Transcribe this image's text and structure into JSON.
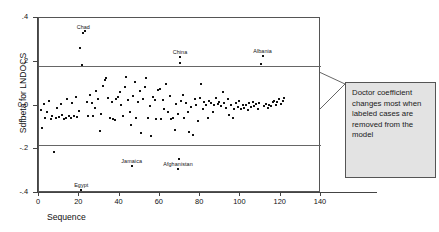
{
  "chart_data": {
    "type": "scatter",
    "title": "",
    "xlabel": "Sequence",
    "ylabel": "Sdfbeta for LNDOCS",
    "xlim": [
      0,
      140
    ],
    "ylim": [
      -0.4,
      0.4
    ],
    "xticks": [
      0,
      20,
      40,
      60,
      80,
      100,
      120,
      140
    ],
    "xtick_labels": [
      "0",
      "20",
      "40",
      "60",
      "80",
      "100",
      "120",
      "140"
    ],
    "yticks": [
      0.4,
      0.2,
      0.0,
      -0.2,
      -0.4
    ],
    "ytick_labels": [
      ".4",
      ".2",
      "0.0",
      "-.2",
      "-.4"
    ],
    "grid": false,
    "legend": null,
    "reference_lines": [
      {
        "orientation": "horizontal",
        "value": 0.18
      },
      {
        "orientation": "horizontal",
        "value": -0.18
      }
    ],
    "annotations": [
      {
        "text": "Doctor coefficient changes most when labeled cases are removed from the model",
        "kind": "callout-box"
      }
    ],
    "point_labels": [
      {
        "label": "Chad",
        "x": 22,
        "y": 0.335
      },
      {
        "label": "China",
        "x": 70,
        "y": 0.222
      },
      {
        "label": "Albania",
        "x": 111,
        "y": 0.228
      },
      {
        "label": "Jamaica",
        "x": 46,
        "y": -0.275
      },
      {
        "label": "Afghanistan",
        "x": 69,
        "y": -0.292
      },
      {
        "label": "Egypt",
        "x": 21,
        "y": -0.388
      }
    ],
    "points": [
      [
        1,
        -0.022
      ],
      [
        1.6,
        -0.105
      ],
      [
        2.4,
        0.005
      ],
      [
        3.2,
        -0.055
      ],
      [
        4.1,
        -0.03
      ],
      [
        5.0,
        0.022
      ],
      [
        5.8,
        -0.06
      ],
      [
        6.6,
        -0.048
      ],
      [
        7.4,
        -0.212
      ],
      [
        8.3,
        -0.057
      ],
      [
        9.1,
        -0.012
      ],
      [
        9.9,
        -0.052
      ],
      [
        10.7,
        0.006
      ],
      [
        11.6,
        -0.044
      ],
      [
        12.4,
        -0.06
      ],
      [
        13.2,
        -0.055
      ],
      [
        14.0,
        0.03
      ],
      [
        14.9,
        -0.046
      ],
      [
        15.7,
        -0.058
      ],
      [
        16.5,
        0.01
      ],
      [
        17.3,
        -0.05
      ],
      [
        18.2,
        0.04
      ],
      [
        19.0,
        -0.052
      ],
      [
        19.8,
        -0.025
      ],
      [
        20.6,
        0.262
      ],
      [
        21.0,
        -0.388
      ],
      [
        21.5,
        0.185
      ],
      [
        21.9,
        0.33
      ],
      [
        22.8,
        0.34
      ],
      [
        23.6,
        0.015
      ],
      [
        24.4,
        -0.047
      ],
      [
        25.2,
        0.05
      ],
      [
        26.1,
        0.012
      ],
      [
        26.9,
        -0.048
      ],
      [
        27.7,
        -0.01
      ],
      [
        28.5,
        0.065
      ],
      [
        29.4,
        0.03
      ],
      [
        30.2,
        -0.115
      ],
      [
        31.0,
        -0.038
      ],
      [
        31.8,
        0.09
      ],
      [
        32.7,
        0.118
      ],
      [
        33.5,
        0.124
      ],
      [
        34.3,
        0.035
      ],
      [
        35.1,
        -0.058
      ],
      [
        36.0,
        0.018
      ],
      [
        36.8,
        -0.062
      ],
      [
        37.6,
        -0.066
      ],
      [
        38.4,
        0.028
      ],
      [
        39.3,
        0.037
      ],
      [
        40.1,
        0.06
      ],
      [
        40.9,
        0.002
      ],
      [
        41.7,
        -0.05
      ],
      [
        42.6,
        0.083
      ],
      [
        43.4,
        0.13
      ],
      [
        44.2,
        0.024
      ],
      [
        45.0,
        -0.03
      ],
      [
        45.9,
        -0.09
      ],
      [
        46.0,
        -0.275
      ],
      [
        46.7,
        0.045
      ],
      [
        47.5,
        0.106
      ],
      [
        48.3,
        -0.055
      ],
      [
        49.1,
        0.016
      ],
      [
        50.0,
        0.068
      ],
      [
        50.8,
        -0.125
      ],
      [
        51.6,
        0.032
      ],
      [
        52.4,
        0.086
      ],
      [
        53.3,
        0.126
      ],
      [
        54.1,
        -0.058
      ],
      [
        54.9,
        0.0
      ],
      [
        55.7,
        -0.138
      ],
      [
        56.6,
        0.04
      ],
      [
        57.4,
        0.025
      ],
      [
        58.2,
        -0.06
      ],
      [
        59.0,
        0.07
      ],
      [
        59.9,
        0.074
      ],
      [
        60.7,
        -0.063
      ],
      [
        61.5,
        0.026
      ],
      [
        62.3,
        -0.018
      ],
      [
        63.2,
        0.1
      ],
      [
        64.0,
        -0.03
      ],
      [
        64.8,
        0.044
      ],
      [
        65.6,
        -0.06
      ],
      [
        66.5,
        -0.057
      ],
      [
        67.3,
        -0.112
      ],
      [
        68.1,
        0.005
      ],
      [
        68.9,
        -0.04
      ],
      [
        69.0,
        -0.292
      ],
      [
        69.5,
        -0.245
      ],
      [
        69.8,
        0.193
      ],
      [
        70.0,
        0.222
      ],
      [
        70.6,
        0.022
      ],
      [
        71.4,
        0.05
      ],
      [
        72.2,
        -0.058
      ],
      [
        73.1,
        0.013
      ],
      [
        73.9,
        -0.03
      ],
      [
        74.7,
        -0.12
      ],
      [
        75.5,
        -0.008
      ],
      [
        76.4,
        -0.134
      ],
      [
        77.2,
        0.028
      ],
      [
        78.0,
        0.002
      ],
      [
        78.8,
        -0.07
      ],
      [
        79.7,
        0.036
      ],
      [
        80.5,
        0.1
      ],
      [
        81.3,
        -0.018
      ],
      [
        82.1,
        0.015
      ],
      [
        83.0,
        0.004
      ],
      [
        83.8,
        -0.055
      ],
      [
        84.6,
        0.02
      ],
      [
        85.4,
        0.012
      ],
      [
        86.3,
        -0.028
      ],
      [
        87.1,
        0.001
      ],
      [
        87.9,
        0.033
      ],
      [
        88.7,
        0.005
      ],
      [
        89.6,
        0.018
      ],
      [
        90.4,
        -0.004
      ],
      [
        91.2,
        0.06
      ],
      [
        92.0,
        0.01
      ],
      [
        92.9,
        -0.01
      ],
      [
        93.7,
        0.028
      ],
      [
        94.5,
        -0.042
      ],
      [
        95.3,
        0.002
      ],
      [
        96.2,
        -0.058
      ],
      [
        97.0,
        -0.016
      ],
      [
        97.8,
        0.013
      ],
      [
        98.6,
        -0.006
      ],
      [
        99.5,
        0.02
      ],
      [
        100.3,
        -0.018
      ],
      [
        101.1,
        0.004
      ],
      [
        101.9,
        -0.012
      ],
      [
        102.8,
        0.002
      ],
      [
        103.6,
        -0.02
      ],
      [
        104.4,
        0.01
      ],
      [
        105.2,
        -0.008
      ],
      [
        106.1,
        0.016
      ],
      [
        106.9,
        -0.004
      ],
      [
        107.7,
        0.006
      ],
      [
        108.5,
        -0.014
      ],
      [
        109.4,
        0.012
      ],
      [
        110.2,
        0.19
      ],
      [
        111.0,
        0.228
      ],
      [
        111.8,
        -0.002
      ],
      [
        112.7,
        0.008
      ],
      [
        113.5,
        -0.01
      ],
      [
        114.3,
        0.004
      ],
      [
        115.1,
        0.0
      ],
      [
        116.0,
        0.014
      ],
      [
        116.8,
        0.022
      ],
      [
        117.6,
        0.002
      ],
      [
        118.4,
        0.018
      ],
      [
        119.3,
        0.028
      ],
      [
        120.1,
        0.008
      ],
      [
        120.9,
        0.02
      ],
      [
        121.7,
        0.034
      ]
    ]
  },
  "axis": {
    "y_title": "Sdfbeta for LNDOCS",
    "x_title": "Sequence"
  },
  "callout": {
    "text": "Doctor coefficient changes most when labeled cases are removed from the model"
  },
  "colors": {
    "point": "#111111",
    "frame": "#555555",
    "ref_line": "#666666",
    "callout_fill": "#e3e3e3"
  }
}
